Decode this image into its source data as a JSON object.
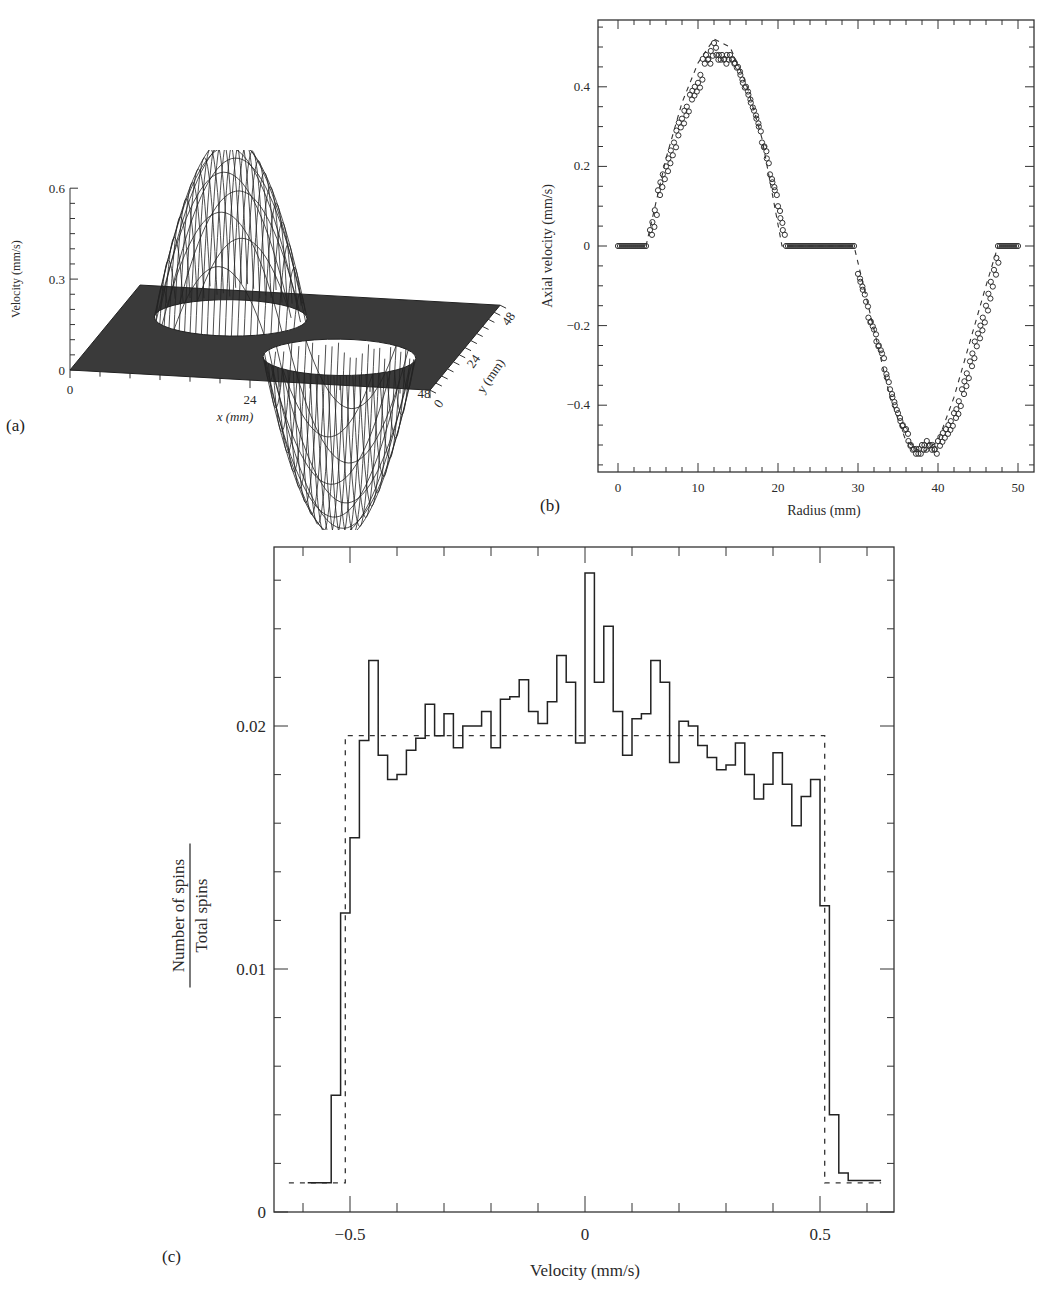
{
  "figure": {
    "panel_labels": [
      "(a)",
      "(b)",
      "(c)"
    ]
  },
  "chart_data": [
    {
      "id": "a",
      "type": "surface3d",
      "title": "",
      "xlabel": "x (mm)",
      "ylabel": "y (mm)",
      "zlabel": "Velocity (mm/s)",
      "x_ticks": [
        "0",
        "24",
        "48"
      ],
      "y_ticks": [
        "0",
        "24",
        "48"
      ],
      "z_ticks": [
        "0",
        "0.3",
        "0.6"
      ],
      "zlim": [
        0,
        0.6
      ],
      "description": "Wireframe surface on 48x48 mm grid: positive paraboloid bump (peak ~0.6 mm/s) centered near x=15, y=33 and negative bump (min ~ -0.6 mm/s) centered near x=33, y=15; flat zero plane elsewhere"
    },
    {
      "id": "b",
      "type": "scatter",
      "title": "",
      "xlabel": "Radius (mm)",
      "ylabel": "Axial velocity (mm/s)",
      "x_ticks": [
        "0",
        "10",
        "20",
        "30",
        "40",
        "50"
      ],
      "y_ticks": [
        "-0.4",
        "-0.2",
        "0",
        "0.2",
        "0.4"
      ],
      "xlim": [
        -2.5,
        52
      ],
      "ylim": [
        -0.56,
        0.57
      ],
      "series": [
        {
          "name": "measured",
          "marker": "open-circle",
          "x": [
            0,
            0.5,
            1,
            1.5,
            2,
            2.5,
            3,
            3.3,
            3.6,
            4,
            4.3,
            4.6,
            5,
            5.3,
            5.6,
            6,
            6.3,
            6.6,
            7,
            7.3,
            7.6,
            8,
            8.3,
            8.6,
            9,
            9.3,
            9.6,
            10,
            10.3,
            10.6,
            11,
            11.3,
            11.6,
            12,
            12.3,
            12.6,
            13,
            13.3,
            13.6,
            14,
            14.3,
            14.6,
            15,
            15.3,
            15.6,
            16,
            16.3,
            16.6,
            17,
            17.3,
            17.6,
            18,
            18.3,
            18.6,
            19,
            19.3,
            19.6,
            20,
            20.3,
            20.6,
            21,
            22,
            23,
            24,
            25,
            26,
            27,
            28,
            29,
            29.5,
            30,
            30.3,
            30.6,
            31,
            31.3,
            31.6,
            32,
            32.3,
            32.6,
            33,
            33.3,
            33.6,
            34,
            34.3,
            34.6,
            35,
            35.3,
            35.6,
            36,
            36.3,
            36.6,
            37,
            37.3,
            37.6,
            38,
            38.3,
            38.6,
            39,
            39.3,
            39.6,
            40,
            40.3,
            40.6,
            41,
            41.3,
            41.6,
            42,
            42.3,
            42.6,
            43,
            43.3,
            43.6,
            44,
            44.3,
            44.6,
            45,
            45.3,
            45.6,
            46,
            46.3,
            46.6,
            47,
            47.3,
            48,
            48.5,
            49,
            49.5,
            50
          ],
          "y": [
            0,
            0,
            0,
            0,
            0,
            0,
            0,
            0,
            0,
            0.04,
            0.06,
            0.09,
            0.14,
            0.16,
            0.18,
            0.2,
            0.22,
            0.24,
            0.26,
            0.29,
            0.31,
            0.32,
            0.34,
            0.35,
            0.38,
            0.39,
            0.4,
            0.41,
            0.43,
            0.47,
            0.48,
            0.47,
            0.49,
            0.51,
            0.48,
            0.48,
            0.48,
            0.47,
            0.48,
            0.48,
            0.47,
            0.46,
            0.45,
            0.43,
            0.41,
            0.4,
            0.38,
            0.36,
            0.34,
            0.32,
            0.3,
            0.26,
            0.25,
            0.22,
            0.18,
            0.16,
            0.14,
            0.1,
            0.07,
            0.04,
            0,
            0,
            0,
            0,
            0,
            0,
            0,
            0,
            0,
            0,
            -0.07,
            -0.09,
            -0.11,
            -0.14,
            -0.18,
            -0.19,
            -0.21,
            -0.24,
            -0.25,
            -0.27,
            -0.31,
            -0.33,
            -0.36,
            -0.38,
            -0.4,
            -0.42,
            -0.44,
            -0.45,
            -0.46,
            -0.49,
            -0.5,
            -0.51,
            -0.51,
            -0.51,
            -0.5,
            -0.5,
            -0.49,
            -0.5,
            -0.5,
            -0.51,
            -0.49,
            -0.48,
            -0.47,
            -0.46,
            -0.45,
            -0.44,
            -0.42,
            -0.41,
            -0.39,
            -0.36,
            -0.34,
            -0.32,
            -0.29,
            -0.27,
            -0.24,
            -0.22,
            -0.2,
            -0.18,
            -0.15,
            -0.12,
            -0.09,
            -0.06,
            -0.03,
            0,
            0,
            0,
            0,
            0
          ]
        },
        {
          "name": "theory",
          "line_style": "dashed",
          "x": [
            3.5,
            6,
            8,
            10,
            12,
            14,
            16,
            18,
            20.5,
            29.5,
            32,
            34,
            36,
            38,
            40,
            42,
            44,
            46,
            47.5
          ],
          "y": [
            0,
            0.22,
            0.36,
            0.46,
            0.52,
            0.5,
            0.41,
            0.27,
            0,
            0,
            -0.21,
            -0.38,
            -0.49,
            -0.52,
            -0.49,
            -0.38,
            -0.24,
            -0.1,
            0
          ]
        }
      ]
    },
    {
      "id": "c",
      "type": "histogram",
      "title": "",
      "xlabel": "Velocity (mm/s)",
      "ylabel_numerator": "Number of spins",
      "ylabel_denominator": "Total spins",
      "x_ticks": [
        "-0.5",
        "0",
        "0.5"
      ],
      "y_ticks": [
        "0",
        "0.01",
        "0.02"
      ],
      "xlim": [
        -0.66,
        0.66
      ],
      "ylim": [
        0,
        0.0274
      ],
      "bin_edges_start": -0.56,
      "bin_width": 0.02,
      "measured": [
        0.0012,
        0.0048,
        0.0123,
        0.0154,
        0.0194,
        0.0227,
        0.0188,
        0.0178,
        0.018,
        0.019,
        0.0195,
        0.0209,
        0.0196,
        0.0205,
        0.0191,
        0.02,
        0.02,
        0.0206,
        0.0191,
        0.0211,
        0.0212,
        0.0219,
        0.0206,
        0.0201,
        0.021,
        0.0229,
        0.0218,
        0.0193,
        0.0263,
        0.0218,
        0.0241,
        0.0206,
        0.0188,
        0.0203,
        0.0205,
        0.0227,
        0.0218,
        0.0185,
        0.0202,
        0.02,
        0.0192,
        0.0187,
        0.0182,
        0.0184,
        0.0193,
        0.018,
        0.017,
        0.0176,
        0.0189,
        0.0176,
        0.0159,
        0.0171,
        0.0178,
        0.0126,
        0.004,
        0.0016
      ],
      "baseline_left": 0.0012,
      "baseline_right": 0.0013,
      "theory": {
        "line_style": "dashed",
        "plateau": 0.0196,
        "x_from": -0.51,
        "x_to": 0.51,
        "outside": 0.0012
      }
    }
  ]
}
